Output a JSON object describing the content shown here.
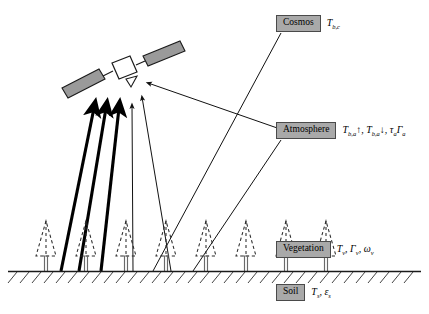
{
  "diagram": {
    "background": "#ffffff",
    "box_fill": "#a9a9a9",
    "box_border": "#4a4a4a",
    "line_color": "#1a1a1a"
  },
  "labels": {
    "cosmos": {
      "name": "Cosmos",
      "symbols_plain": "Tb,c",
      "symbols": [
        {
          "base": "T",
          "sub": "b,c"
        }
      ]
    },
    "atmosphere": {
      "name": "Atmosphere",
      "symbols_plain": "Tb,a↑, Tb,a↓, τa Γa",
      "symbols": [
        {
          "base": "T",
          "sub": "b,a",
          "arrow": "↑"
        },
        {
          "base": "T",
          "sub": "b,a",
          "arrow": "↓"
        },
        {
          "base": "τ",
          "sub": "a"
        },
        {
          "base": "Γ",
          "sub": "a"
        }
      ]
    },
    "vegetation": {
      "name": "Vegetation",
      "symbols_plain": "Tv, Γv, ωv",
      "symbols": [
        {
          "base": "T",
          "sub": "v"
        },
        {
          "base": "Γ",
          "sub": "v"
        },
        {
          "base": "ω",
          "sub": "v"
        }
      ]
    },
    "soil": {
      "name": "Soil",
      "symbols_plain": "Ts, εs",
      "symbols": [
        {
          "base": "T",
          "sub": "s"
        },
        {
          "base": "ε",
          "sub": "s"
        }
      ]
    }
  },
  "scene": {
    "satellite": {
      "name": "satellite",
      "body_fill": "#ffffff",
      "panel_fill": "#9a9a9a"
    },
    "ground": {
      "name": "ground-line",
      "hatch_count": 34
    },
    "vegetation_row": {
      "name": "tree-row",
      "tree_count": 8,
      "style": "dashed-outline-conifer"
    },
    "emission_arrows": {
      "name": "thick-upwelling-arrows",
      "count": 3,
      "style": "thick"
    },
    "thin_arrows": {
      "name": "thin-upwelling-arrows",
      "count": 2,
      "style": "thin"
    }
  }
}
